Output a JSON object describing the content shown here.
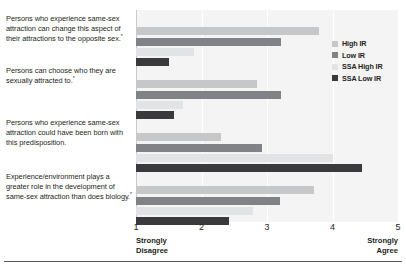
{
  "chart_data": {
    "type": "bar",
    "orientation": "horizontal",
    "title": "",
    "xlabel": "",
    "ylabel": "",
    "xlim": [
      1,
      5
    ],
    "xticks": [
      1,
      2,
      3,
      4,
      5
    ],
    "xtick_labels": [
      "1",
      "2",
      "3",
      "4",
      "5"
    ],
    "axis_anchor_low": "Strongly\nDisagree",
    "axis_anchor_low_line1": "Strongly",
    "axis_anchor_low_line2": "Disagree",
    "axis_anchor_high_line1": "Strongly",
    "axis_anchor_high_line2": "Agree",
    "grid": true,
    "legend_position": "right",
    "categories": [
      "Persons who experience same-sex attraction can change this aspect of their attractions to the opposite sex.",
      "Persons can choose who they are sexually attracted to.",
      "Persons who experience same-sex attraction could have been born with this predisposition.",
      "Experience/environment plays a greater role in the development of same-sex attraction than does biology."
    ],
    "category_footnote_marks": [
      "*",
      "*",
      "",
      "*"
    ],
    "series": [
      {
        "name": "High IR",
        "color": "#c6c7c9",
        "values": [
          3.8,
          2.85,
          2.3,
          3.72
        ]
      },
      {
        "name": "Low IR",
        "color": "#808285",
        "values": [
          3.22,
          3.22,
          2.92,
          3.2
        ]
      },
      {
        "name": "SSA High IR",
        "color": "#e2e3e4",
        "values": [
          1.88,
          1.72,
          4.0,
          2.78
        ]
      },
      {
        "name": "SSA Low IR",
        "color": "#3a3a3c",
        "values": [
          1.5,
          1.58,
          4.45,
          2.42
        ]
      }
    ]
  },
  "legend": {
    "items": [
      {
        "label": "High IR",
        "color": "#c6c7c9"
      },
      {
        "label": "Low IR",
        "color": "#808285"
      },
      {
        "label": "SSA High IR",
        "color": "#e2e3e4"
      },
      {
        "label": "SSA Low IR",
        "color": "#3a3a3c"
      }
    ]
  }
}
